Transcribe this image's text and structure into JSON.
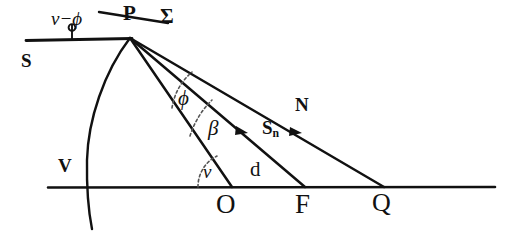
{
  "figure": {
    "background_color": "#ffffff",
    "stroke_color": "#111111",
    "dash_color": "#555555",
    "width": 506,
    "height": 237
  },
  "labels": {
    "nu_minus_phi": "ν−ϕ",
    "sigma": "Σ",
    "point_p": "P",
    "point_s": "S",
    "point_v": "V",
    "point_o": "O",
    "point_f": "F",
    "point_q": "Q",
    "ray_n": "N",
    "ray_sn_base": "S",
    "ray_sn_sub": "n",
    "segment_d": "d",
    "angle_phi": "ϕ",
    "angle_beta": "β",
    "angle_nu": "ν"
  },
  "geometry": {
    "vertex_p": {
      "x": 130,
      "y": 38
    },
    "baseline": {
      "x1": 48,
      "y1": 187,
      "x2": 495,
      "y2": 187
    },
    "surface_line_s": {
      "x1": 26,
      "y1": 40,
      "x2": 130,
      "y2": 38
    },
    "sigma_line": {
      "x1": 99,
      "y1": 13,
      "x2": 166,
      "y2": 23
    },
    "rays": [
      {
        "name": "ray-to-O",
        "x1": 130,
        "y1": 38,
        "x2": 232,
        "y2": 186,
        "arrow": false
      },
      {
        "name": "ray-to-F",
        "x1": 130,
        "y1": 38,
        "x2": 305,
        "y2": 187,
        "arrow": true
      },
      {
        "name": "ray-to-Q",
        "x1": 130,
        "y1": 38,
        "x2": 383,
        "y2": 187,
        "arrow": true
      }
    ],
    "wavefront_arc": {
      "from_x": 130,
      "from_y": 38,
      "to_x": 92,
      "to_y": 228
    },
    "tick_mark": {
      "x": 72,
      "y": 40
    }
  }
}
